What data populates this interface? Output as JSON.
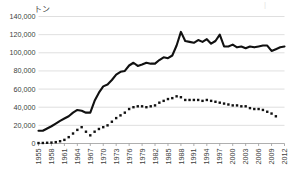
{
  "chart_data": {
    "type": "line",
    "title": "",
    "subtitle": "",
    "xlabel": "",
    "ylabel": "トン",
    "unit_label": "トン",
    "ylim": [
      0,
      140000
    ],
    "xlim": [
      1955,
      2012
    ],
    "grid": true,
    "legend": "none",
    "ytick_labels": [
      "0",
      "20,000",
      "40,000",
      "60,000",
      "80,000",
      "100,000",
      "120,000",
      "140,000"
    ],
    "ytick_values": [
      0,
      20000,
      40000,
      60000,
      80000,
      100000,
      120000,
      140000
    ],
    "xtick_labels": [
      "1955",
      "1958",
      "1961",
      "1964",
      "1967",
      "1970",
      "1973",
      "1976",
      "1979",
      "1982",
      "1985",
      "1988",
      "1991",
      "1994",
      "1997",
      "2000",
      "2003",
      "2006",
      "2009",
      "2012"
    ],
    "xtick_values": [
      1955,
      1958,
      1961,
      1964,
      1967,
      1970,
      1973,
      1976,
      1979,
      1982,
      1985,
      1988,
      1991,
      1994,
      1997,
      2000,
      2003,
      2006,
      2009,
      2012
    ],
    "x": [
      1955,
      1956,
      1957,
      1958,
      1959,
      1960,
      1961,
      1962,
      1963,
      1964,
      1965,
      1966,
      1967,
      1968,
      1969,
      1970,
      1971,
      1972,
      1973,
      1974,
      1975,
      1976,
      1977,
      1978,
      1979,
      1980,
      1981,
      1982,
      1983,
      1984,
      1985,
      1986,
      1987,
      1988,
      1989,
      1990,
      1991,
      1992,
      1993,
      1994,
      1995,
      1996,
      1997,
      1998,
      1999,
      2000,
      2001,
      2002,
      2003,
      2004,
      2005,
      2006,
      2007,
      2008,
      2009,
      2010,
      2011,
      2012
    ],
    "series": [
      {
        "name": "solid-series",
        "style": "solid",
        "color": "#111111",
        "values": [
          14000,
          14000,
          16500,
          19000,
          22000,
          25000,
          27500,
          30000,
          34000,
          37000,
          36000,
          34000,
          34000,
          47000,
          56000,
          63000,
          65000,
          70000,
          76000,
          79000,
          80000,
          86000,
          89000,
          85500,
          87000,
          89000,
          88000,
          88000,
          92000,
          95000,
          94000,
          97000,
          108000,
          123000,
          113000,
          112000,
          111000,
          114000,
          112000,
          115000,
          110000,
          113000,
          120000,
          107000,
          107000,
          109000,
          106000,
          107000,
          105000,
          107000,
          106000,
          107000,
          108000,
          108000,
          102000,
          104000,
          106000,
          107000
        ]
      },
      {
        "name": "dotted-series",
        "style": "dotted",
        "color": "#111111",
        "values": [
          500,
          600,
          800,
          1000,
          1500,
          2500,
          4000,
          7000,
          11000,
          15000,
          18000,
          13000,
          9000,
          13000,
          16000,
          18000,
          20000,
          24000,
          28000,
          31000,
          34000,
          38000,
          40000,
          41000,
          41000,
          40000,
          41000,
          42000,
          45000,
          47000,
          49000,
          50000,
          52000,
          51000,
          48000,
          48000,
          48000,
          48000,
          47000,
          48000,
          47000,
          46000,
          45000,
          44000,
          43000,
          42000,
          42000,
          41000,
          41000,
          39000,
          38000,
          38000,
          37000,
          35000,
          33000,
          30000,
          null,
          null
        ]
      }
    ]
  },
  "annotations": {
    "corner_mark": "|"
  }
}
